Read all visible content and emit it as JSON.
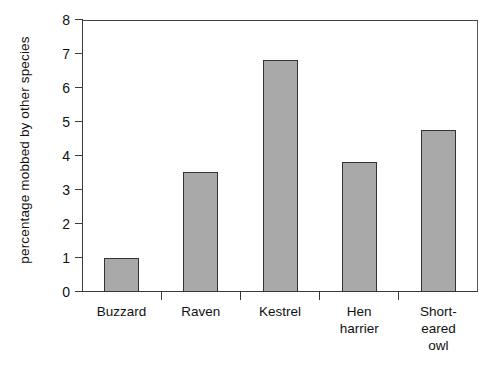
{
  "chart_data": {
    "type": "bar",
    "title": "",
    "xlabel": "",
    "ylabel": "percentage mobbed by other species",
    "categories": [
      "Buzzard",
      "Raven",
      "Kestrel",
      "Hen harrier",
      "Short-eared owl"
    ],
    "category_labels_multiline": [
      "Buzzard",
      "Raven",
      "Kestrel",
      "Hen\nharrier",
      "Short-\neared\nowl"
    ],
    "values": [
      1.0,
      3.53,
      6.82,
      3.82,
      4.76
    ],
    "ylim": [
      0,
      8
    ],
    "yticks": [
      0,
      1,
      2,
      3,
      4,
      5,
      6,
      7,
      8
    ],
    "ytick_labels": [
      "0",
      "1",
      "2",
      "3",
      "4",
      "5",
      "6",
      "7",
      "8"
    ],
    "grid": false,
    "legend": null,
    "bar_fill_color": "#a9a9a9",
    "bar_edge_color": "#333333",
    "axis_color": "#3a3a3a",
    "background_color": "#ffffff"
  },
  "axes": {
    "y_title": "percentage mobbed by other species"
  }
}
